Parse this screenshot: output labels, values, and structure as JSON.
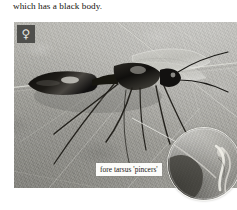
{
  "page": {
    "background_color": "#ffffff",
    "width": 237,
    "height": 210
  },
  "body_text": {
    "line": "which has a black body."
  },
  "figure": {
    "media_type": "photograph",
    "background_description": "pale grey-green leaf surface with diagonal veins",
    "colors": {
      "leaf_light": "#b9b8b2",
      "leaf_mid": "#a4a39d",
      "leaf_dark": "#8e8d88",
      "insect_body": "#141310",
      "vein_highlight": "#e8e8e2",
      "label_background": "#fbfbf9",
      "label_text": "#1a1814",
      "badge_background": "#4f4f4c",
      "badge_glyph": "#e6e6e2"
    },
    "sex_badge": {
      "symbol": "♀",
      "meaning": "female",
      "icon_name": "female-symbol-icon"
    },
    "annotation_label": {
      "text": "fore tarsus 'pincers'"
    },
    "inset": {
      "shape": "circle",
      "description": "magnified detail of the fore tarsus pincers",
      "leader_line": "white hairline from fore tarsus to inset circle"
    }
  }
}
